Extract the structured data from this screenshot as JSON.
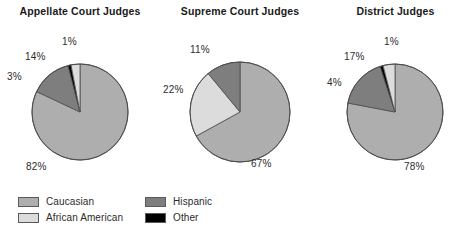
{
  "figure": {
    "background": "#ffffff",
    "palette": {
      "caucasian": "#aeaeae",
      "african_american": "#dcdcdc",
      "hispanic": "#7e7e7e",
      "other": "#000000",
      "outline": "#4d4d4d"
    }
  },
  "chart_data": [
    {
      "type": "pie",
      "title": "Appellate Court Judges",
      "categories": [
        "Caucasian",
        "Hispanic",
        "Other",
        "African American"
      ],
      "values": [
        82,
        14,
        1,
        3
      ],
      "labels": [
        "82%",
        "14%",
        "1%",
        "3%"
      ],
      "legend_position": "bottom",
      "start_angle": 0,
      "direction": "clockwise"
    },
    {
      "type": "pie",
      "title": "Supreme Court Judges",
      "categories": [
        "Caucasian",
        "African American",
        "Hispanic"
      ],
      "values": [
        67,
        22,
        11
      ],
      "labels": [
        "67%",
        "22%",
        "11%"
      ],
      "legend_position": "bottom",
      "start_angle": 0,
      "direction": "clockwise"
    },
    {
      "type": "pie",
      "title": "District Judges",
      "categories": [
        "Caucasian",
        "Hispanic",
        "Other",
        "African American"
      ],
      "values": [
        78,
        17,
        1,
        4
      ],
      "labels": [
        "78%",
        "17%",
        "1%",
        "4%"
      ],
      "legend_position": "bottom",
      "start_angle": 0,
      "direction": "clockwise"
    }
  ],
  "charts": [
    {
      "title": "Appellate Court Judges",
      "slice_labels": [
        {
          "text": "1%",
          "x": 62,
          "y": 36
        },
        {
          "text": "14%",
          "x": 25,
          "y": 51
        },
        {
          "text": "3%",
          "x": 7,
          "y": 71
        },
        {
          "text": "82%",
          "x": 26,
          "y": 161
        }
      ]
    },
    {
      "title": "Supreme Court Judges",
      "slice_labels": [
        {
          "text": "11%",
          "x": 30,
          "y": 44
        },
        {
          "text": "22%",
          "x": 3,
          "y": 84
        },
        {
          "text": "67%",
          "x": 91,
          "y": 158
        }
      ]
    },
    {
      "title": "District Judges",
      "slice_labels": [
        {
          "text": "1%",
          "x": 64,
          "y": 36
        },
        {
          "text": "17%",
          "x": 24,
          "y": 51
        },
        {
          "text": "4%",
          "x": 7,
          "y": 77
        },
        {
          "text": "78%",
          "x": 84,
          "y": 161
        }
      ]
    }
  ],
  "legend": {
    "items": [
      {
        "label": "Caucasian",
        "color": "#aeaeae",
        "row": 0,
        "col": 0
      },
      {
        "label": "Hispanic",
        "color": "#7e7e7e",
        "row": 0,
        "col": 1
      },
      {
        "label": "African American",
        "color": "#dcdcdc",
        "row": 1,
        "col": 0
      },
      {
        "label": "Other",
        "color": "#000000",
        "row": 1,
        "col": 1
      }
    ]
  }
}
